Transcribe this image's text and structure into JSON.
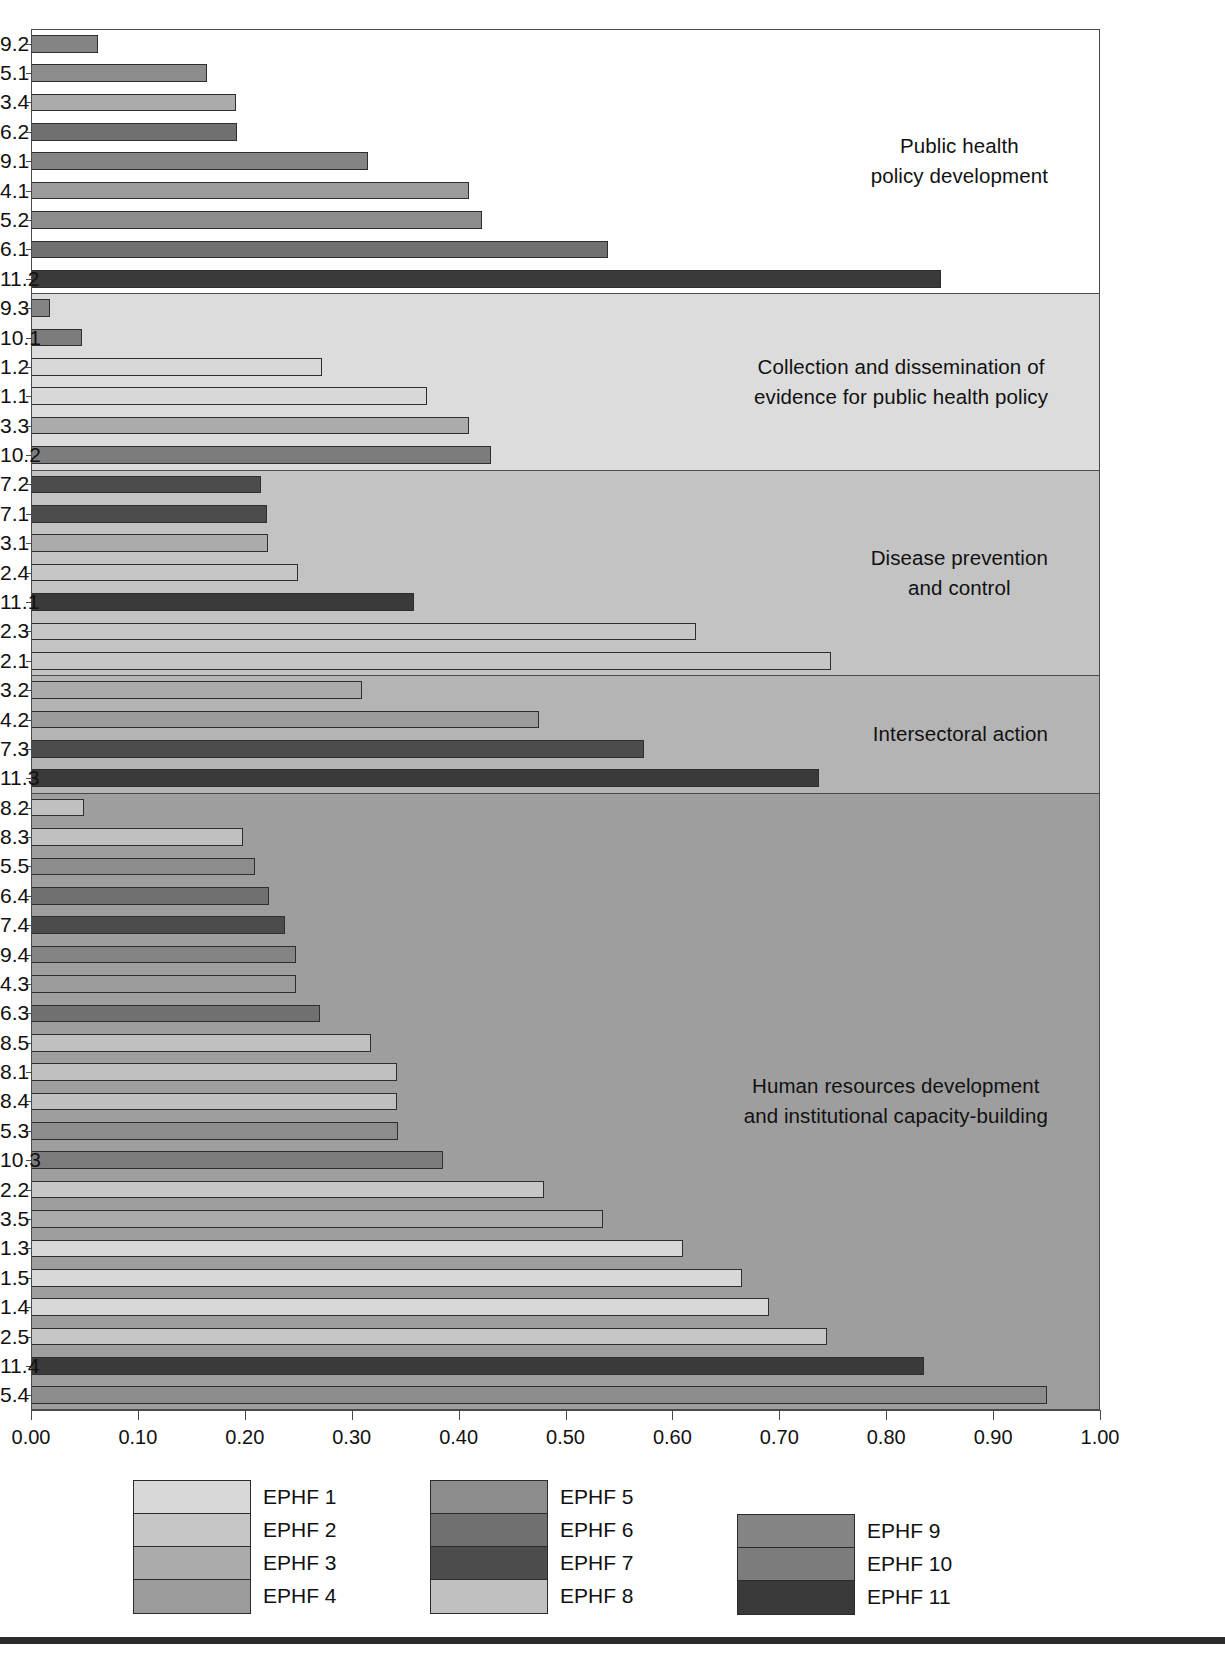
{
  "chart_data": {
    "type": "bar",
    "orientation": "horizontal",
    "title": "",
    "xlabel": "",
    "ylabel": "",
    "xlim": [
      0.0,
      1.0
    ],
    "xticks": [
      "0.00",
      "0.10",
      "0.20",
      "0.30",
      "0.40",
      "0.50",
      "0.60",
      "0.70",
      "0.80",
      "0.90",
      "1.00"
    ],
    "grid": false,
    "legend_position": "bottom",
    "legend": [
      {
        "label": "EPHF 1",
        "color": "#d8d8d8"
      },
      {
        "label": "EPHF 2",
        "color": "#c6c6c6"
      },
      {
        "label": "EPHF 3",
        "color": "#ababab"
      },
      {
        "label": "EPHF 4",
        "color": "#9b9b9b"
      },
      {
        "label": "EPHF 5",
        "color": "#8c8c8c"
      },
      {
        "label": "EPHF 6",
        "color": "#707070"
      },
      {
        "label": "EPHF 7",
        "color": "#4c4c4c"
      },
      {
        "label": "EPHF 8",
        "color": "#c0c0c0"
      },
      {
        "label": "EPHF 9",
        "color": "#848484"
      },
      {
        "label": "EPHF 10",
        "color": "#7c7c7c"
      },
      {
        "label": "EPHF 11",
        "color": "#3a3a3a"
      }
    ],
    "groups": [
      {
        "label": "Public health\npolicy development",
        "band_color": "#ffffff",
        "bars": [
          {
            "category": "9.2",
            "value": 0.063,
            "series": "EPHF 9",
            "color": "#848484"
          },
          {
            "category": "5.1",
            "value": 0.165,
            "series": "EPHF 5",
            "color": "#8c8c8c"
          },
          {
            "category": "3.4",
            "value": 0.192,
            "series": "EPHF 3",
            "color": "#ababab"
          },
          {
            "category": "6.2",
            "value": 0.193,
            "series": "EPHF 6",
            "color": "#707070"
          },
          {
            "category": "9.1",
            "value": 0.315,
            "series": "EPHF 9",
            "color": "#848484"
          },
          {
            "category": "4.1",
            "value": 0.41,
            "series": "EPHF 4",
            "color": "#9b9b9b"
          },
          {
            "category": "5.2",
            "value": 0.422,
            "series": "EPHF 5",
            "color": "#8c8c8c"
          },
          {
            "category": "6.1",
            "value": 0.54,
            "series": "EPHF 6",
            "color": "#707070"
          },
          {
            "category": "11.2",
            "value": 0.851,
            "series": "EPHF 11",
            "color": "#3a3a3a"
          }
        ]
      },
      {
        "label": "Collection and dissemination of\nevidence for public health policy",
        "band_color": "#dcdcdc",
        "bars": [
          {
            "category": "9.3",
            "value": 0.018,
            "series": "EPHF 9",
            "color": "#848484"
          },
          {
            "category": "10.1",
            "value": 0.048,
            "series": "EPHF 10",
            "color": "#7c7c7c"
          },
          {
            "category": "1.2",
            "value": 0.272,
            "series": "EPHF 1",
            "color": "#d8d8d8"
          },
          {
            "category": "1.1",
            "value": 0.37,
            "series": "EPHF 1",
            "color": "#d8d8d8"
          },
          {
            "category": "3.3",
            "value": 0.41,
            "series": "EPHF 3",
            "color": "#ababab"
          },
          {
            "category": "10.2",
            "value": 0.43,
            "series": "EPHF 10",
            "color": "#7c7c7c"
          }
        ]
      },
      {
        "label": "Disease prevention\nand control",
        "band_color": "#c3c3c3",
        "bars": [
          {
            "category": "7.2",
            "value": 0.215,
            "series": "EPHF 7",
            "color": "#4c4c4c"
          },
          {
            "category": "7.1",
            "value": 0.221,
            "series": "EPHF 7",
            "color": "#4c4c4c"
          },
          {
            "category": "3.1",
            "value": 0.222,
            "series": "EPHF 3",
            "color": "#ababab"
          },
          {
            "category": "2.4",
            "value": 0.25,
            "series": "EPHF 2",
            "color": "#c6c6c6"
          },
          {
            "category": "11.1",
            "value": 0.358,
            "series": "EPHF 11",
            "color": "#3a3a3a"
          },
          {
            "category": "2.3",
            "value": 0.622,
            "series": "EPHF 2",
            "color": "#c6c6c6"
          },
          {
            "category": "2.1",
            "value": 0.748,
            "series": "EPHF 2",
            "color": "#c6c6c6"
          }
        ]
      },
      {
        "label": "Intersectoral action",
        "band_color": "#b4b4b4",
        "bars": [
          {
            "category": "3.2",
            "value": 0.31,
            "series": "EPHF 3",
            "color": "#ababab"
          },
          {
            "category": "4.2",
            "value": 0.475,
            "series": "EPHF 4",
            "color": "#9b9b9b"
          },
          {
            "category": "7.3",
            "value": 0.573,
            "series": "EPHF 7",
            "color": "#4c4c4c"
          },
          {
            "category": "11.3",
            "value": 0.737,
            "series": "EPHF 11",
            "color": "#3a3a3a"
          }
        ]
      },
      {
        "label": "Human resources development\nand institutional capacity-building",
        "band_color": "#9e9e9e",
        "bars": [
          {
            "category": "8.2",
            "value": 0.05,
            "series": "EPHF 8",
            "color": "#c0c0c0"
          },
          {
            "category": "8.3",
            "value": 0.198,
            "series": "EPHF 8",
            "color": "#c0c0c0"
          },
          {
            "category": "5.5",
            "value": 0.21,
            "series": "EPHF 5",
            "color": "#8c8c8c"
          },
          {
            "category": "6.4",
            "value": 0.223,
            "series": "EPHF 6",
            "color": "#707070"
          },
          {
            "category": "7.4",
            "value": 0.238,
            "series": "EPHF 7",
            "color": "#4c4c4c"
          },
          {
            "category": "9.4",
            "value": 0.248,
            "series": "EPHF 9",
            "color": "#848484"
          },
          {
            "category": "4.3",
            "value": 0.248,
            "series": "EPHF 4",
            "color": "#9b9b9b"
          },
          {
            "category": "6.3",
            "value": 0.27,
            "series": "EPHF 6",
            "color": "#707070"
          },
          {
            "category": "8.5",
            "value": 0.318,
            "series": "EPHF 8",
            "color": "#c0c0c0"
          },
          {
            "category": "8.1",
            "value": 0.342,
            "series": "EPHF 8",
            "color": "#c0c0c0"
          },
          {
            "category": "8.4",
            "value": 0.342,
            "series": "EPHF 8",
            "color": "#c0c0c0"
          },
          {
            "category": "5.3",
            "value": 0.343,
            "series": "EPHF 5",
            "color": "#8c8c8c"
          },
          {
            "category": "10.3",
            "value": 0.385,
            "series": "EPHF 10",
            "color": "#7c7c7c"
          },
          {
            "category": "2.2",
            "value": 0.48,
            "series": "EPHF 2",
            "color": "#c6c6c6"
          },
          {
            "category": "3.5",
            "value": 0.535,
            "series": "EPHF 3",
            "color": "#ababab"
          },
          {
            "category": "1.3",
            "value": 0.61,
            "series": "EPHF 1",
            "color": "#d8d8d8"
          },
          {
            "category": "1.5",
            "value": 0.665,
            "series": "EPHF 1",
            "color": "#d8d8d8"
          },
          {
            "category": "1.4",
            "value": 0.69,
            "series": "EPHF 1",
            "color": "#d8d8d8"
          },
          {
            "category": "2.5",
            "value": 0.745,
            "series": "EPHF 2",
            "color": "#c6c6c6"
          },
          {
            "category": "11.4",
            "value": 0.835,
            "series": "EPHF 11",
            "color": "#3a3a3a"
          },
          {
            "category": "5.4",
            "value": 0.95,
            "series": "EPHF 5",
            "color": "#8c8c8c"
          }
        ]
      }
    ]
  }
}
